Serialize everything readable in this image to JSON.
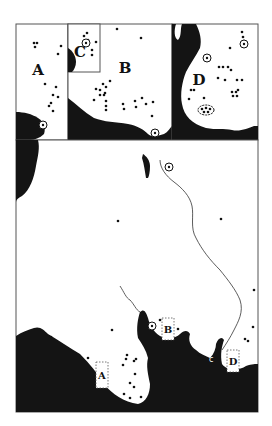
{
  "colors": {
    "land": "#ffffff",
    "sea": "#141414",
    "frame": "#555555",
    "site": "#111111"
  },
  "insets": {
    "A": {
      "label": "A",
      "label_pos": [
        38,
        75
      ],
      "box": [
        16,
        24,
        52,
        116
      ],
      "sites": [
        [
          34,
          43
        ],
        [
          37,
          43
        ],
        [
          35,
          47
        ],
        [
          61,
          46
        ],
        [
          58,
          54
        ],
        [
          45,
          84
        ],
        [
          56,
          87
        ],
        [
          53,
          95
        ],
        [
          58,
          97
        ],
        [
          51,
          103
        ],
        [
          49,
          106
        ],
        [
          53,
          111
        ]
      ],
      "circle_sites": [
        [
          43,
          125
        ]
      ]
    },
    "C": {
      "label": "C",
      "label_pos": [
        80,
        57
      ],
      "box": [
        68,
        24,
        32,
        48
      ],
      "sites": [
        [
          84,
          36
        ],
        [
          87,
          33
        ],
        [
          88,
          40
        ],
        [
          96,
          42
        ],
        [
          92,
          50
        ],
        [
          92,
          55
        ]
      ],
      "circle_sites": [
        [
          86,
          43
        ]
      ]
    },
    "B": {
      "label": "B",
      "label_pos": [
        125,
        73
      ],
      "box": [
        68,
        24,
        104,
        116
      ],
      "sites": [
        [
          117,
          29
        ],
        [
          141,
          38
        ],
        [
          96,
          89
        ],
        [
          100,
          90
        ],
        [
          103,
          84
        ],
        [
          106,
          87
        ],
        [
          110,
          81
        ],
        [
          100,
          95
        ],
        [
          104,
          95
        ],
        [
          105,
          93
        ],
        [
          94,
          100
        ],
        [
          106,
          101
        ],
        [
          106,
          106
        ],
        [
          106,
          110
        ],
        [
          123,
          104
        ],
        [
          124,
          109
        ],
        [
          135,
          101
        ],
        [
          136,
          107
        ],
        [
          142,
          98
        ],
        [
          146,
          104
        ],
        [
          153,
          102
        ],
        [
          152,
          116
        ]
      ],
      "circle_sites": [
        [
          155,
          133
        ]
      ]
    },
    "D": {
      "label": "D",
      "label_pos": [
        199,
        85
      ],
      "box": [
        172,
        24,
        86,
        116
      ],
      "sites": [
        [
          242,
          32
        ],
        [
          243,
          37
        ],
        [
          244,
          41
        ],
        [
          230,
          48
        ],
        [
          225,
          80
        ],
        [
          228,
          67
        ],
        [
          223,
          67
        ],
        [
          219,
          67
        ],
        [
          218,
          78
        ],
        [
          231,
          70
        ],
        [
          237,
          80
        ],
        [
          242,
          80
        ],
        [
          232,
          92
        ],
        [
          236,
          92
        ],
        [
          237,
          96
        ],
        [
          233,
          96
        ],
        [
          238,
          90
        ],
        [
          191,
          90
        ],
        [
          194,
          90
        ],
        [
          189,
          99
        ],
        [
          204,
          98
        ]
      ],
      "circle_sites": [
        [
          207,
          58
        ],
        [
          244,
          44
        ]
      ],
      "cluster": [
        206,
        110
      ]
    }
  },
  "main_map": {
    "box": [
      16,
      140,
      242,
      272
    ],
    "sites": [
      [
        118,
        221
      ],
      [
        221,
        219
      ],
      [
        254,
        290
      ],
      [
        51,
        337
      ],
      [
        112,
        330
      ],
      [
        88,
        358
      ],
      [
        127,
        355
      ],
      [
        126,
        359
      ],
      [
        123,
        365
      ],
      [
        136,
        359
      ],
      [
        134,
        361
      ],
      [
        135,
        374
      ],
      [
        130,
        383
      ],
      [
        134,
        387
      ],
      [
        124,
        394
      ],
      [
        130,
        398
      ],
      [
        141,
        397
      ],
      [
        160,
        320
      ],
      [
        178,
        329
      ],
      [
        253,
        327
      ],
      [
        245,
        339
      ],
      [
        248,
        341
      ],
      [
        199,
        355
      ]
    ],
    "circle_sites": [
      [
        152,
        326
      ],
      [
        169,
        167
      ]
    ],
    "inset_markers": [
      {
        "label": "A",
        "x": 96,
        "y": 362,
        "w": 12,
        "h": 26
      },
      {
        "label": "B",
        "x": 162,
        "y": 318,
        "w": 12,
        "h": 22
      },
      {
        "label": "D",
        "x": 227,
        "y": 350,
        "w": 12,
        "h": 22
      }
    ],
    "small_labels": [
      {
        "text": "c",
        "x": 209,
        "y": 362
      }
    ]
  }
}
